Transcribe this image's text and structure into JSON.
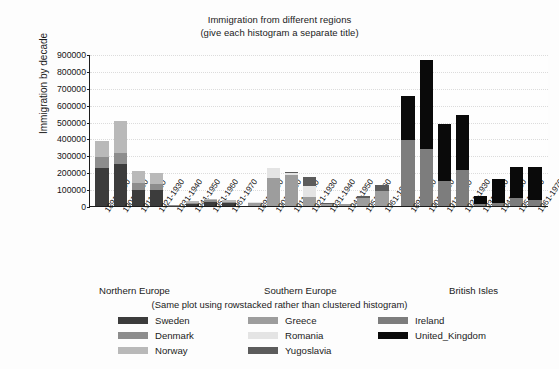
{
  "chart_data": {
    "type": "bar",
    "title": "Immigration from different regions",
    "subtitle": "(give each histogram a separate title)",
    "note": "(Same plot using rowstacked rather than clustered histogram)",
    "xlabel": "",
    "ylabel": "Immigration by decade",
    "ylim": [
      0,
      900000
    ],
    "ytick_labels": [
      "0",
      "100000",
      "200000",
      "300000",
      "400000",
      "500000",
      "600000",
      "700000",
      "800000",
      "900000"
    ],
    "ytick_values": [
      0,
      100000,
      200000,
      300000,
      400000,
      500000,
      600000,
      700000,
      800000,
      900000
    ],
    "grid": true,
    "stacked": true,
    "legend_position": "bottom",
    "categories": [
      "1891-1900",
      "1901-1910",
      "1911-1920",
      "1921-1930",
      "1931-1940",
      "1941-1950",
      "1951-1960",
      "1961-1970"
    ],
    "panels": [
      {
        "name": "Northern Europe",
        "series": [
          {
            "name": "Sweden",
            "color": "#3c3c3c",
            "values": [
              226000,
              250000,
              95000,
              97000,
              3000,
              11000,
              22000,
              17000
            ]
          },
          {
            "name": "Denmark",
            "color": "#8d8d8d",
            "values": [
              63000,
              65000,
              42000,
              32000,
              2000,
              9000,
              11000,
              9000
            ]
          },
          {
            "name": "Norway",
            "color": "#b9b9b9",
            "values": [
              95000,
              190000,
              69000,
              68000,
              4000,
              10000,
              9000,
              9000
            ]
          }
        ]
      },
      {
        "name": "Southern Europe",
        "series": [
          {
            "name": "Greece",
            "color": "#9d9d9d",
            "values": [
              16000,
              167000,
              184000,
              51000,
              9000,
              9000,
              48000,
              86000
            ]
          },
          {
            "name": "Romania",
            "color": "#e4e4e4",
            "values": [
              7000,
              57000,
              14000,
              68000,
              4000,
              1000,
              1000,
              3000
            ]
          },
          {
            "name": "Yugoslavia",
            "color": "#5c5c5c",
            "values": [
              0,
              0,
              2000,
              50000,
              2000,
              2000,
              9000,
              36000
            ]
          }
        ]
      },
      {
        "name": "British Isles",
        "series": [
          {
            "name": "Ireland",
            "color": "#7d7d7d",
            "values": [
              388000,
              339000,
              146000,
              211000,
              11000,
              20000,
              48000,
              33000
            ]
          },
          {
            "name": "United_Kingdom",
            "color": "#0a0a0a",
            "values": [
              264000,
              526000,
              341000,
              330000,
              50000,
              140000,
              185000,
              200000
            ]
          }
        ]
      }
    ]
  },
  "legend": {
    "headers": [
      {
        "label": "Northern Europe"
      },
      {
        "label": "Southern Europe"
      },
      {
        "label": "British Isles"
      }
    ],
    "columns": [
      [
        {
          "label": "Sweden",
          "color": "#3c3c3c"
        },
        {
          "label": "Denmark",
          "color": "#8d8d8d"
        },
        {
          "label": "Norway",
          "color": "#b9b9b9"
        }
      ],
      [
        {
          "label": "Greece",
          "color": "#9d9d9d"
        },
        {
          "label": "Romania",
          "color": "#e4e4e4"
        },
        {
          "label": "Yugoslavia",
          "color": "#5c5c5c"
        }
      ],
      [
        {
          "label": "Ireland",
          "color": "#7d7d7d"
        },
        {
          "label": "United_Kingdom",
          "color": "#0a0a0a"
        }
      ]
    ]
  }
}
